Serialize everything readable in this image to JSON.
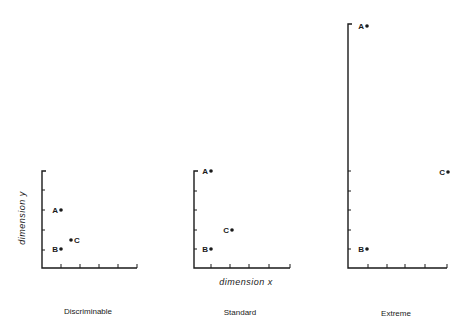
{
  "panels": [
    {
      "name": "discriminable",
      "caption": "Discriminable",
      "axis": {
        "x0": 42,
        "y_top": 171,
        "y_base": 268,
        "x_end": 137,
        "y_ticks": [
          190,
          210,
          230,
          250
        ],
        "x_ticks": [
          61,
          80,
          99,
          118,
          137
        ]
      },
      "points": [
        {
          "label": "A",
          "x": 61,
          "y": 210,
          "label_side": "left"
        },
        {
          "label": "B",
          "x": 61,
          "y": 249,
          "label_side": "left"
        },
        {
          "label": "C",
          "x": 71,
          "y": 240,
          "label_side": "right"
        }
      ],
      "caption_pos": {
        "x": 88,
        "y": 312
      }
    },
    {
      "name": "standard",
      "caption": "Standard",
      "axis": {
        "x0": 194,
        "y_top": 171,
        "y_base": 268,
        "x_end": 290,
        "y_ticks": [
          191,
          210,
          230,
          249
        ],
        "x_ticks": [
          211,
          230,
          249,
          269,
          290
        ]
      },
      "points": [
        {
          "label": "A",
          "x": 211,
          "y": 171,
          "label_side": "left"
        },
        {
          "label": "B",
          "x": 211,
          "y": 249,
          "label_side": "left"
        },
        {
          "label": "C",
          "x": 232,
          "y": 230,
          "label_side": "left"
        }
      ],
      "caption_pos": {
        "x": 240,
        "y": 313
      }
    },
    {
      "name": "extreme",
      "caption": "Extreme",
      "axis": {
        "x0": 348,
        "y_top": 24,
        "y_base": 268,
        "x_end": 447,
        "y_ticks": [
          171,
          191,
          210,
          230,
          249
        ],
        "x_ticks": [
          368,
          387,
          405,
          425,
          447
        ]
      },
      "points": [
        {
          "label": "A",
          "x": 367,
          "y": 26,
          "label_side": "left"
        },
        {
          "label": "B",
          "x": 367,
          "y": 249,
          "label_side": "left"
        },
        {
          "label": "C",
          "x": 448,
          "y": 172,
          "label_side": "left"
        }
      ],
      "caption_pos": {
        "x": 396,
        "y": 314
      }
    }
  ],
  "axis_labels": {
    "y": "dimension  y",
    "x": "dimension  x"
  },
  "colors": {
    "ink": "#1a1a1a",
    "background": "#ffffff"
  }
}
